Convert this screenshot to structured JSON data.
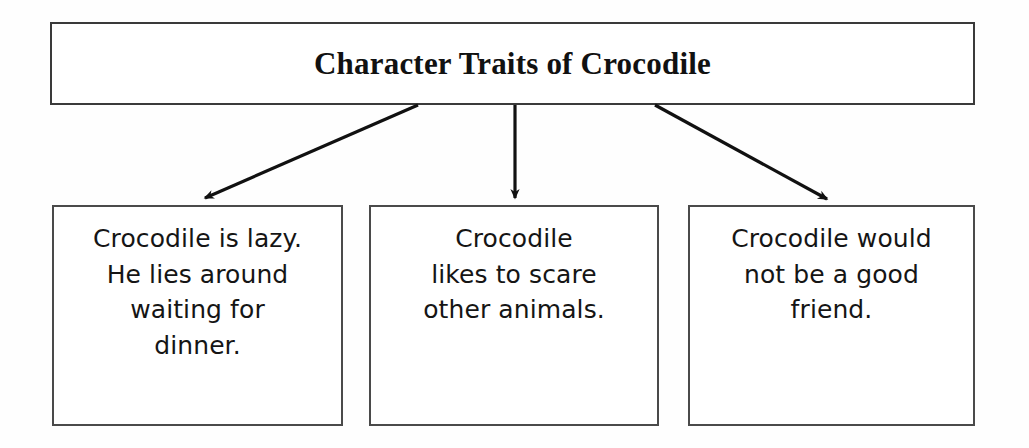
{
  "diagram": {
    "type": "hierarchy-flowchart",
    "title_box": {
      "label": "Character Traits of Crocodile"
    },
    "connectors": [
      {
        "name": "arrow-to-trait-1",
        "direction": "down-left",
        "from": [
          418,
          105
        ],
        "to": [
          200,
          201
        ]
      },
      {
        "name": "arrow-to-trait-2",
        "direction": "down",
        "from": [
          515,
          105
        ],
        "to": [
          515,
          203
        ]
      },
      {
        "name": "arrow-to-trait-3",
        "direction": "down-right",
        "from": [
          655,
          105
        ],
        "to": [
          832,
          202
        ]
      }
    ],
    "trait_boxes": [
      {
        "id": "trait-1",
        "lines": [
          "Crocodile is lazy.",
          "He lies around",
          "waiting for",
          "dinner."
        ]
      },
      {
        "id": "trait-2",
        "lines": [
          "Crocodile",
          "likes to scare",
          "other animals."
        ]
      },
      {
        "id": "trait-3",
        "lines": [
          "Crocodile would",
          "not be a good",
          "friend."
        ]
      }
    ],
    "colors": {
      "background": "#fefefe",
      "box_border": "#3a3a3a",
      "text": "#111111",
      "arrow": "#111111"
    }
  }
}
